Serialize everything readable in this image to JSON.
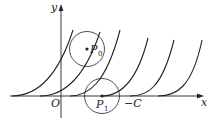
{
  "figure": {
    "type": "curve-family-diagram",
    "axes": {
      "x_label": "x",
      "y_label": "y",
      "origin_label": "O",
      "marked_x_value": "−C"
    },
    "points": [
      {
        "name": "P",
        "subscript": "0",
        "description": "point inside upper circle on a curve"
      },
      {
        "name": "P",
        "subscript": "1",
        "description": "point on x-axis where a curve starts"
      }
    ],
    "curves_count": 5,
    "circles_count": 2,
    "colors": {
      "stroke": "#222222",
      "background": "#ffffff"
    }
  }
}
